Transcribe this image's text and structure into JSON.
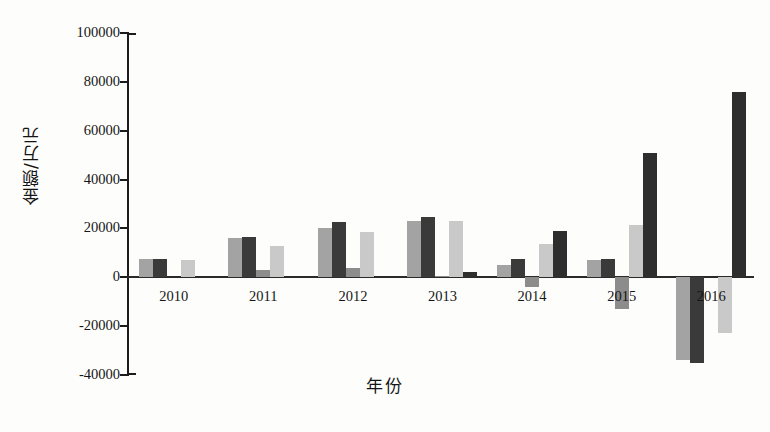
{
  "chart_data": {
    "type": "bar",
    "title": "",
    "xlabel": "年份",
    "ylabel": "金额/万元",
    "ylim": [
      -40000,
      100000
    ],
    "ytick_values": [
      100000,
      80000,
      60000,
      40000,
      20000,
      0,
      -20000,
      -40000
    ],
    "ytick_labels": [
      "100000",
      "80000",
      "60000",
      "40000",
      "20000",
      "0",
      "-20000",
      "-40000"
    ],
    "categories": [
      "2010",
      "2011",
      "2012",
      "2013",
      "2014",
      "2015",
      "2016"
    ],
    "grid": false,
    "legend": "none",
    "series": [
      {
        "name": "series-1",
        "color": "#a3a3a3",
        "values": [
          7500,
          16000,
          20000,
          23000,
          5000,
          7000,
          -34000
        ]
      },
      {
        "name": "series-2",
        "color": "#3a3a3a",
        "values": [
          7500,
          16500,
          22500,
          24500,
          7500,
          7500,
          -35000
        ]
      },
      {
        "name": "series-3",
        "color": "#8c8c8c",
        "values": [
          0,
          3000,
          4000,
          700,
          -4000,
          -13000,
          0
        ]
      },
      {
        "name": "series-4",
        "color": "#c9c9c9",
        "values": [
          7000,
          13000,
          18500,
          23000,
          13500,
          21500,
          -23000
        ]
      },
      {
        "name": "series-5",
        "color": "#2e2e2e",
        "values": [
          0,
          0,
          0,
          2300,
          19000,
          51000,
          76000
        ]
      }
    ]
  },
  "axis": {
    "y_axis_color": "#1c1c1c",
    "zero_line_color": "#2a2a2a"
  }
}
